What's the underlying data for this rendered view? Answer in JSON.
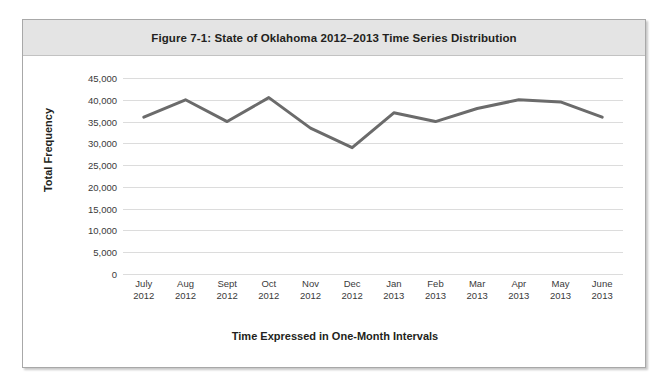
{
  "figure": {
    "title": "Figure 7-1: State of Oklahoma 2012–2013 Time Series Distribution"
  },
  "colors": {
    "line": "#6b6b6b",
    "grid": "#dcdcdc",
    "title_band": "#e4e4e4",
    "border": "#a8a8a8",
    "text": "#231f20"
  },
  "chart_data": {
    "type": "line",
    "title": "Figure 7-1: State of Oklahoma 2012–2013 Time Series Distribution",
    "xlabel": "Time Expressed in One-Month Intervals",
    "ylabel": "Total Frequency",
    "categories": [
      "July 2012",
      "Aug 2012",
      "Sept 2012",
      "Oct 2012",
      "Nov 2012",
      "Dec 2012",
      "Jan 2013",
      "Feb 2013",
      "Mar 2013",
      "Apr 2013",
      "May 2013",
      "June 2013"
    ],
    "category_lines": [
      [
        "July",
        "2012"
      ],
      [
        "Aug",
        "2012"
      ],
      [
        "Sept",
        "2012"
      ],
      [
        "Oct",
        "2012"
      ],
      [
        "Nov",
        "2012"
      ],
      [
        "Dec",
        "2012"
      ],
      [
        "Jan",
        "2013"
      ],
      [
        "Feb",
        "2013"
      ],
      [
        "Mar",
        "2013"
      ],
      [
        "Apr",
        "2013"
      ],
      [
        "May",
        "2013"
      ],
      [
        "June",
        "2013"
      ]
    ],
    "values": [
      36000,
      40000,
      35000,
      40500,
      33500,
      29000,
      37000,
      35000,
      38000,
      40000,
      39500,
      36000
    ],
    "ylim": [
      0,
      45000
    ],
    "ytick_values": [
      45000,
      40000,
      35000,
      30000,
      25000,
      20000,
      15000,
      10000,
      5000,
      0
    ],
    "ytick_labels": [
      "45,000",
      "40,000",
      "35,000",
      "30,000",
      "25,000",
      "20,000",
      "15,000",
      "10,000",
      "5,000",
      "0"
    ],
    "grid": true,
    "grid_axis": "y",
    "legend": false,
    "series_name": "Total Frequency",
    "line_color": "#6b6b6b",
    "line_width": 3,
    "markers": false
  }
}
